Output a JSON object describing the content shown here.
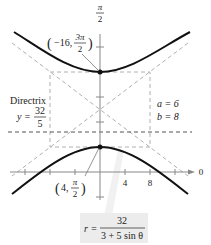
{
  "diagram": {
    "type": "polar-hyperbola",
    "equation": {
      "lhs": "r =",
      "numerator": "32",
      "denominator": "3 + 5 sin θ"
    },
    "vertices": [
      {
        "label_r": "−16,",
        "label_theta_num": "3π",
        "label_theta_den": "2"
      },
      {
        "label_r": "4,",
        "label_theta_num": "π",
        "label_theta_den": "2"
      }
    ],
    "directrix": {
      "title": "Directrix",
      "lhs": "y =",
      "numerator": "32",
      "denominator": "5"
    },
    "parameters": {
      "a": "a = 6",
      "b": "b = 8"
    },
    "axes": {
      "vertical_label_num": "π",
      "vertical_label_den": "2",
      "horizontal_label": "0",
      "ticks": [
        "4",
        "8"
      ]
    },
    "colors": {
      "curve": "#111111",
      "axis": "#888888",
      "dashed": "#aaaaaa",
      "equation_bg": "#ececec"
    }
  }
}
